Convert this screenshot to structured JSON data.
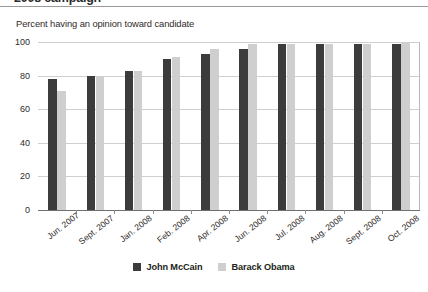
{
  "cropped_header": "2008 campaign",
  "chart_data": {
    "type": "bar",
    "title": "Percent having an opinion toward candidate",
    "subtitle": "Percent having an opinion toward candidate",
    "xlabel": "",
    "ylabel": "",
    "ylim": [
      0,
      100
    ],
    "yticks": [
      0,
      20,
      40,
      60,
      80,
      100
    ],
    "ytick_labels": [
      "0",
      "20",
      "40",
      "60",
      "80",
      "100"
    ],
    "grid": true,
    "legend_position": "bottom-center",
    "categories": [
      "Jun. 2007",
      "Sept. 2007",
      "Jan. 2008",
      "Feb. 2008",
      "Apr. 2008",
      "Jun. 2008",
      "Jul. 2008",
      "Aug. 2008",
      "Sept. 2008",
      "Oct. 2008"
    ],
    "series": [
      {
        "name": "John McCain",
        "color": "#3c3c3c",
        "values": [
          78,
          80,
          83,
          90,
          93,
          96,
          99,
          99,
          99,
          99
        ]
      },
      {
        "name": "Barack Obama",
        "color": "#cfcfcf",
        "values": [
          71,
          79,
          83,
          91,
          96,
          99,
          99,
          99,
          99,
          100
        ]
      }
    ]
  }
}
